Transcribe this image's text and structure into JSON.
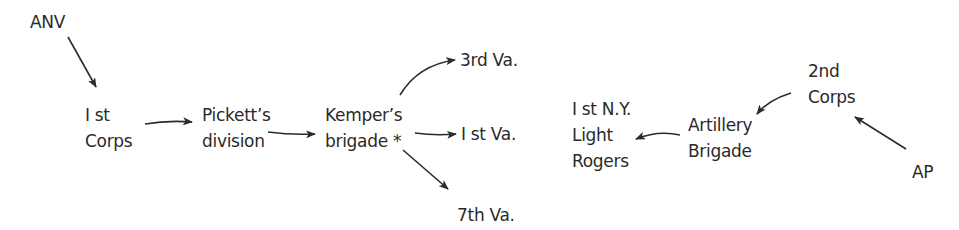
{
  "diagram": {
    "nodes": {
      "anv": {
        "lines": [
          "ANV"
        ]
      },
      "first_corps": {
        "lines": [
          "I st",
          "Corps"
        ]
      },
      "picketts_division": {
        "lines": [
          "Pickett’s",
          "division"
        ]
      },
      "kempers_brigade": {
        "lines": [
          "Kemper’s",
          "brigade *"
        ]
      },
      "third_va": {
        "lines": [
          "3rd Va."
        ]
      },
      "first_va": {
        "lines": [
          "I st Va."
        ]
      },
      "seventh_va": {
        "lines": [
          "7th Va."
        ]
      },
      "first_ny_light_rogers": {
        "lines": [
          "I st N.Y.",
          "Light",
          "Rogers"
        ]
      },
      "artillery_brigade": {
        "lines": [
          "Artillery",
          "Brigade"
        ]
      },
      "second_corps": {
        "lines": [
          "2nd",
          "Corps"
        ]
      },
      "ap": {
        "lines": [
          "AP"
        ]
      }
    },
    "edges": [
      {
        "from": "anv",
        "to": "first_corps"
      },
      {
        "from": "first_corps",
        "to": "picketts_division"
      },
      {
        "from": "picketts_division",
        "to": "kempers_brigade"
      },
      {
        "from": "kempers_brigade",
        "to": "third_va"
      },
      {
        "from": "kempers_brigade",
        "to": "first_va"
      },
      {
        "from": "kempers_brigade",
        "to": "seventh_va"
      },
      {
        "from": "ap",
        "to": "second_corps"
      },
      {
        "from": "second_corps",
        "to": "artillery_brigade"
      },
      {
        "from": "artillery_brigade",
        "to": "first_ny_light_rogers"
      }
    ]
  }
}
